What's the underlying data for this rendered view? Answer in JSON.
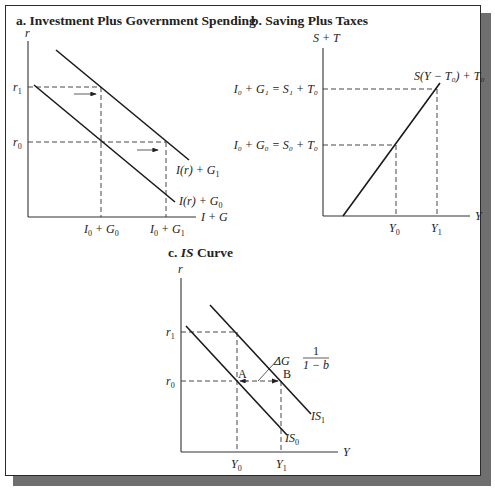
{
  "panels": {
    "a": {
      "title": "a. Investment Plus Government Spending",
      "y_axis_label": "r",
      "x_axis_label": "I + G",
      "y_ticks": [
        {
          "base": "r",
          "sub": "1"
        },
        {
          "base": "r",
          "sub": "0"
        }
      ],
      "x_ticks": [
        {
          "pre": "I",
          "pre_sub": "0",
          "mid": " + G",
          "sub": "0"
        },
        {
          "pre": "I",
          "pre_sub": "0",
          "mid": " + G",
          "sub": "1"
        }
      ],
      "curves": [
        {
          "name": "I(r) + G",
          "sub": "1"
        },
        {
          "name": "I(r) + G",
          "sub": "0"
        }
      ]
    },
    "b": {
      "title": "b. Saving Plus Taxes",
      "y_axis_label": "S + T",
      "x_axis_label": "Y",
      "y_ticks": [
        {
          "text": "I₀ + G₁ = S₁ + T₀"
        },
        {
          "text": "I₀ + G₀ = S₀ + T₀"
        }
      ],
      "x_ticks": [
        {
          "base": "Y",
          "sub": "0"
        },
        {
          "base": "Y",
          "sub": "1"
        }
      ],
      "curve_label": "S(Y − T₀) + T₀"
    },
    "c": {
      "title_prefix": "c. ",
      "title_italic": "IS",
      "title_suffix": " Curve",
      "y_axis_label": "r",
      "x_axis_label": "Y",
      "y_ticks": [
        {
          "base": "r",
          "sub": "1"
        },
        {
          "base": "r",
          "sub": "0"
        }
      ],
      "x_ticks": [
        {
          "base": "Y",
          "sub": "0"
        },
        {
          "base": "Y",
          "sub": "1"
        }
      ],
      "curves": [
        {
          "base": "IS",
          "sub": "1"
        },
        {
          "base": "IS",
          "sub": "0"
        }
      ],
      "points": [
        "A",
        "B"
      ],
      "multiplier": {
        "prefix": "ΔG",
        "numerator": "1",
        "denominator": "1 − b"
      }
    }
  },
  "colors": {
    "line": "#1a1a1a",
    "shadow": "#6f6f6f",
    "background": "#ffffff"
  }
}
